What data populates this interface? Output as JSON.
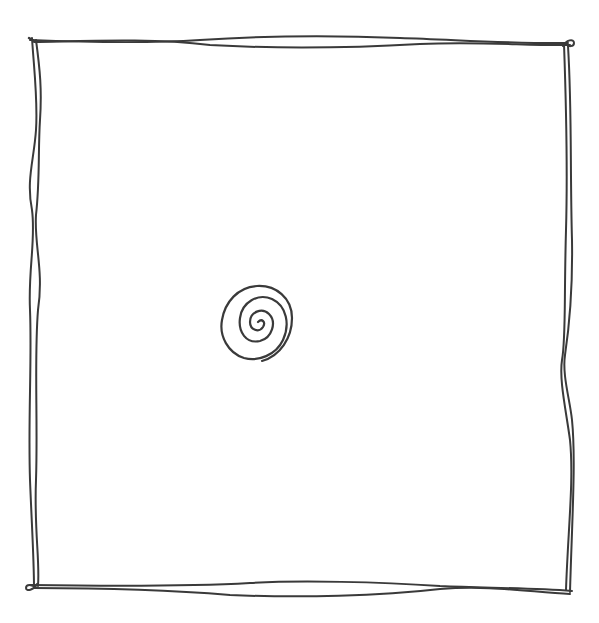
{
  "drawing": {
    "description": "Hand-drawn sketch: double-line wobbly square frame with a small spiral inside",
    "background_color": "#ffffff",
    "ink_color": "#3a3a3a",
    "frame": {
      "top_left": [
        32,
        40
      ],
      "top_right": [
        570,
        44
      ],
      "bottom_right": [
        570,
        592
      ],
      "bottom_left": [
        32,
        587
      ]
    },
    "spiral": {
      "center": [
        258,
        322
      ],
      "outer_width": 70,
      "outer_height": 80,
      "turns": 3
    }
  }
}
